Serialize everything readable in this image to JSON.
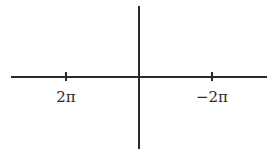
{
  "diagram": {
    "type": "coordinate-axes",
    "horizontal_axis": {
      "ticks": [
        {
          "label": "2π",
          "x": 66
        },
        {
          "label": "−2π",
          "x": 212
        }
      ]
    },
    "vertical_axis": {
      "ticks": []
    },
    "colors": {
      "axis": "#2a2a2a",
      "background": "#ffffff"
    }
  }
}
